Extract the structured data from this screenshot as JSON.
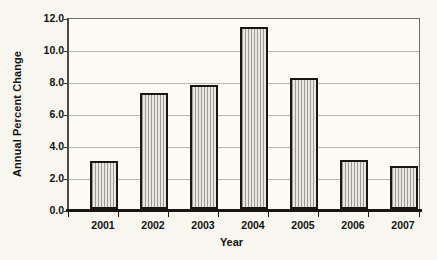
{
  "chart_data": {
    "type": "bar",
    "title": "",
    "subtitle": "",
    "xlabel": "Year",
    "ylabel": "Annual Percent Change",
    "categories": [
      "2001",
      "2002",
      "2003",
      "2004",
      "2005",
      "2006",
      "2007"
    ],
    "values": [
      3.0,
      7.3,
      7.8,
      11.5,
      8.3,
      3.1,
      2.7
    ],
    "series": [
      {
        "name": "Annual Percent Change",
        "values": [
          3.0,
          7.3,
          7.8,
          11.5,
          8.3,
          3.1,
          2.7
        ]
      }
    ],
    "ylim": [
      0.0,
      12.0
    ],
    "ytick_step": 2.0,
    "yticks": [
      "0.0",
      "2.0",
      "4.0",
      "6.0",
      "8.0",
      "10.0",
      "12.0"
    ],
    "ytick_values": [
      0.0,
      2.0,
      4.0,
      6.0,
      8.0,
      10.0,
      12.0
    ],
    "grid": true,
    "grid_axis": "y",
    "legend": false,
    "legend_position": "none",
    "annotations": []
  },
  "style": {
    "background": "#f7f6ef",
    "plot_background": "#fbfaf4",
    "bar_fill": "#d4d3cb",
    "bar_hatch": "#9c9c94",
    "bar_border": "#17170f",
    "gridline": "#b9b9b0",
    "axis": "#17170f",
    "text": "#121210"
  }
}
